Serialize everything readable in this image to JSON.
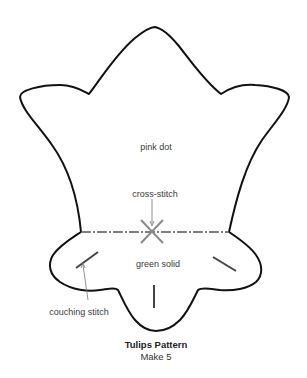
{
  "diagram": {
    "title": "Tulips Pattern",
    "subtitle": "Make 5",
    "labels": {
      "upper_fabric": "pink dot",
      "cross_stitch": "cross-stitch",
      "lower_fabric": "green solid",
      "couching": "couching stitch"
    },
    "colors": {
      "outline": "#111111",
      "stitch": "#555555",
      "cross": "#8a8a8a",
      "leader": "#777777"
    }
  }
}
